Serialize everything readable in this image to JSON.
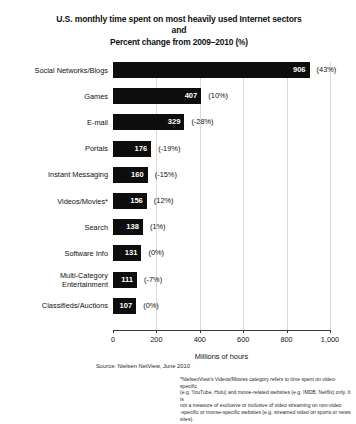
{
  "title": {
    "line1": "U.S. monthly time spent on most heavily used Internet sectors",
    "line2": "and",
    "line3": "Percent change from 2009–2010 (%)"
  },
  "footer": {
    "source": "Source: Nielsen NetView, June 2010",
    "footnote_line1": "*NielsenView's Videos/Movies category refers to time spent on video-specific",
    "footnote_line2": "(e.g. YouTube, Hulu) and movie-related websites (e.g. IMDB, Netflix) only. It is",
    "footnote_line3": "not a measure of exclusive or inclusive of video streaming on non-video",
    "footnote_line4": "-specific or movse-specific websites (e.g. streamed video on sports or news sites)."
  },
  "chart_data": {
    "type": "bar",
    "orientation": "horizontal",
    "title": "U.S. monthly time spent on most heavily used Internet sectors and Percent change from 2009–2010 (%)",
    "xlabel": "Millions of hours",
    "ylabel": "",
    "xlim": [
      0,
      1000
    ],
    "grid": true,
    "legend": "none",
    "xticks": [
      0,
      200,
      400,
      600,
      800,
      1000
    ],
    "xtick_labels": [
      "0",
      "200",
      "400",
      "600",
      "800",
      "1,000"
    ],
    "categories": [
      "Social Networks/Blogs",
      "Games",
      "E-mail",
      "Portals",
      "Instant Messaging",
      "Videos/Movies*",
      "Search",
      "Software Info",
      "Multi-Category Entertainment",
      "Classifieds/Auctions"
    ],
    "values": [
      906,
      407,
      329,
      176,
      160,
      156,
      138,
      131,
      111,
      107
    ],
    "value_labels": [
      "906",
      "407",
      "329",
      "176",
      "160",
      "156",
      "138",
      "131",
      "111",
      "107"
    ],
    "percent_change": [
      43,
      10,
      -28,
      -19,
      -15,
      12,
      1,
      0,
      -7,
      0
    ],
    "percent_labels": [
      "(43%)",
      "(10%)",
      "(-28%)",
      "(-19%)",
      "(-15%)",
      "(12%)",
      "(1%)",
      "(0%)",
      "(-7%)",
      "(0%)"
    ],
    "bar_color": "#0d0d0d",
    "value_label_color": "#ffffff"
  }
}
